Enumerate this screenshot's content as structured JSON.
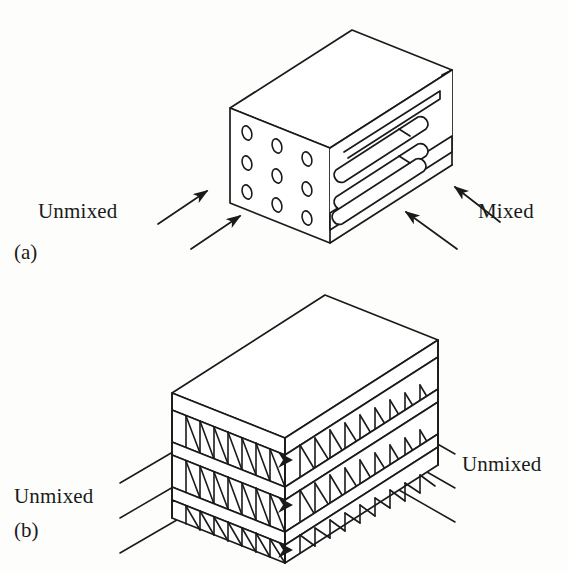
{
  "figure": {
    "background_color": "#fdfdfc",
    "line_color": "#1a1a1a",
    "fill_color": "#ffffff"
  },
  "panels": [
    {
      "tag": "(a)",
      "tag_x": 14,
      "tag_y": 253,
      "description": "finned-tube cross-flow heat exchanger, one fluid mixed one unmixed",
      "labels": [
        {
          "text": "Unmixed",
          "x": 38,
          "y": 212,
          "align": "left"
        },
        {
          "text": "Mixed",
          "x": 478,
          "y": 212,
          "align": "left"
        }
      ]
    },
    {
      "tag": "(b)",
      "tag_x": 14,
      "tag_y": 516,
      "description": "plate-fin cross-flow heat exchanger, both fluids unmixed",
      "labels": [
        {
          "text": "Unmixed",
          "x": 14,
          "y": 478,
          "align": "left"
        },
        {
          "text": "Unmixed",
          "x": 462,
          "y": 446,
          "align": "left"
        }
      ]
    }
  ],
  "panel_a": {
    "tube_hole_rows": 3,
    "tube_hole_cols": 3,
    "tube_hole_count": 9,
    "internal_tube_count": 3,
    "inlet_arrow_count": 2,
    "outlet_arrow_count": 2,
    "inlet_label": "Unmixed",
    "outlet_label": "Mixed"
  },
  "panel_b": {
    "fin_layer_count": 3,
    "plate_count": 4,
    "left_flow_line_count": 3,
    "right_flow_line_count": 3,
    "left_label": "Unmixed",
    "right_label": "Unmixed",
    "fin_shape": "triangular-corrugated"
  }
}
